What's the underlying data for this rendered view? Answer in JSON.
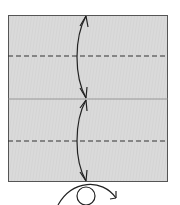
{
  "diagram": {
    "type": "origami-fold-diagram",
    "paper": {
      "fill": "#d9d9d9",
      "stroke": "#555555",
      "x": 8,
      "y": 15,
      "width": 160,
      "height": 167
    },
    "creases": [
      {
        "kind": "valley-fold",
        "style": "dashed",
        "y": 56
      },
      {
        "kind": "existing-crease",
        "style": "solid",
        "y": 99
      },
      {
        "kind": "valley-fold",
        "style": "dashed",
        "y": 141
      }
    ],
    "arrows": [
      {
        "kind": "fold-and-unfold",
        "from": "top-edge",
        "to": "center-line"
      },
      {
        "kind": "fold-and-unfold",
        "from": "center-line",
        "to": "bottom-edge"
      }
    ],
    "symbols": [
      {
        "kind": "turn-over",
        "position": "bottom-center"
      }
    ],
    "colors": {
      "paper": "#d9d9d9",
      "line": "#333333",
      "edge": "#555555"
    }
  }
}
